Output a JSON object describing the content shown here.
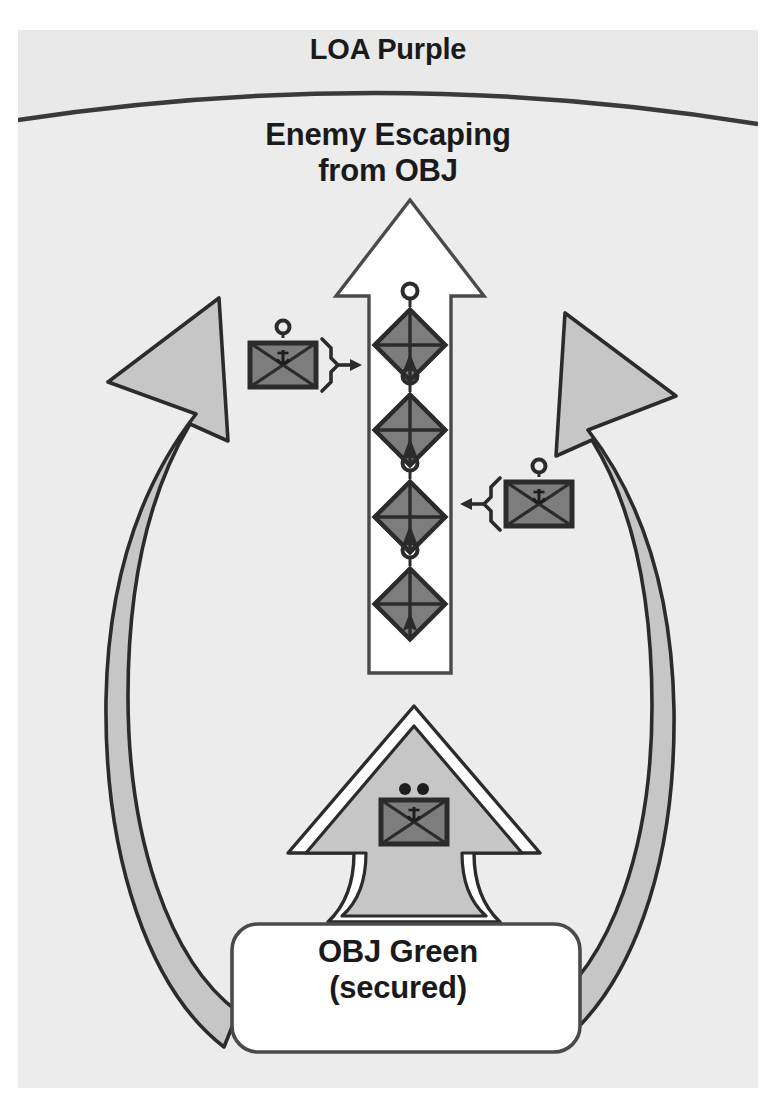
{
  "diagram": {
    "type": "military-tactical-graphic",
    "title_top": "LOA Purple",
    "enemy_note": "Enemy Escaping\nfrom OBJ",
    "objective_label": "OBJ Green\n(secured)",
    "colors": {
      "page_background": "#ffffff",
      "frame_background": "#e9e9e9",
      "inner_zone": "#ececec",
      "unit_fill": "#7d7d7d",
      "arrow_gray": "#c6c6c6",
      "arrow_white": "#ffffff",
      "stroke": "#2b2b2b",
      "text": "#1a1a1a"
    },
    "control_measures": [
      {
        "name": "limit-of-advance",
        "label": "LOA Purple",
        "shape": "arc",
        "position": "top"
      },
      {
        "name": "objective",
        "label": "OBJ Green (secured)",
        "shape": "rounded-rectangle",
        "position": "bottom-center"
      }
    ],
    "movement_arrows": [
      {
        "name": "enemy-withdrawal-axis",
        "style": "white-outlined-arrow",
        "direction": "north",
        "annotation": "Enemy Escaping from OBJ"
      },
      {
        "name": "friendly-envelopment-left",
        "style": "curved-gray-arrow",
        "direction": "north-east"
      },
      {
        "name": "friendly-envelopment-right",
        "style": "curved-gray-arrow",
        "direction": "north-west"
      },
      {
        "name": "friendly-main-attack",
        "style": "gray-attack-arrow",
        "direction": "north"
      }
    ],
    "enemy_units": [
      {
        "name": "enemy-unit-1",
        "echelon": "platoon",
        "affiliation": "hostile",
        "symbol": "diamond-quartered-with-arrowhead"
      },
      {
        "name": "enemy-unit-2",
        "echelon": "platoon",
        "affiliation": "hostile",
        "symbol": "diamond-quartered-with-arrowhead"
      },
      {
        "name": "enemy-unit-3",
        "echelon": "platoon",
        "affiliation": "hostile",
        "symbol": "diamond-quartered-with-arrowhead"
      },
      {
        "name": "enemy-unit-4",
        "echelon": "platoon",
        "affiliation": "hostile",
        "symbol": "diamond-quartered-with-arrowhead"
      }
    ],
    "friendly_units": [
      {
        "name": "friendly-unit-left",
        "echelon": "platoon",
        "affiliation": "friendly",
        "symbol": "rectangle-x-mechanized",
        "pointer": "right-arrow-bracket"
      },
      {
        "name": "friendly-unit-right",
        "echelon": "platoon",
        "affiliation": "friendly",
        "symbol": "rectangle-x-mechanized",
        "pointer": "left-arrow-bracket"
      },
      {
        "name": "friendly-unit-center",
        "echelon": "company",
        "affiliation": "friendly",
        "symbol": "rectangle-x-mechanized",
        "pointer": "none"
      }
    ]
  }
}
